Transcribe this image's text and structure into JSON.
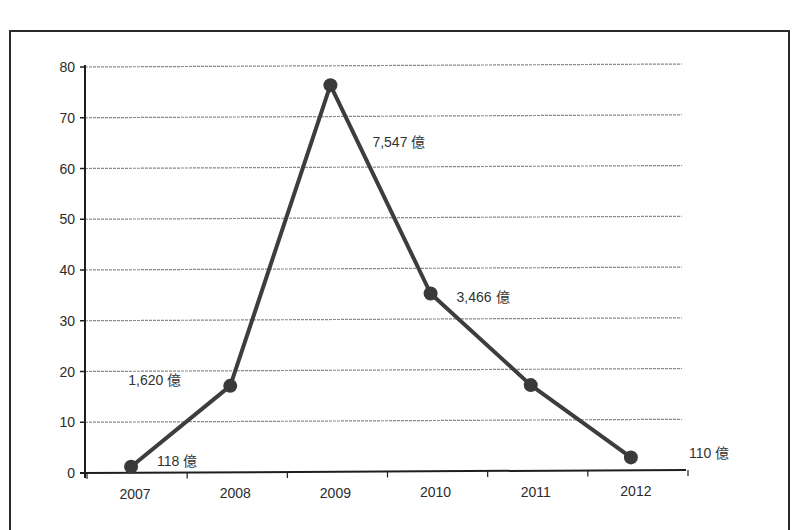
{
  "chart_data": {
    "type": "line",
    "title": "",
    "xlabel": "",
    "ylabel": "",
    "categories": [
      "2007",
      "2008",
      "2009",
      "2010",
      "2011",
      "2012"
    ],
    "series": [
      {
        "name": "",
        "values": [
          1.2,
          17.1,
          76.3,
          35.2,
          17.1,
          2.8
        ],
        "color": "#3d3d3d"
      }
    ],
    "y_ticks": [
      "0",
      "10",
      "20",
      "30",
      "40",
      "50",
      "60",
      "70",
      "80"
    ],
    "ylim": [
      0,
      80
    ],
    "grid": true,
    "legend": "none",
    "annotations": [
      {
        "text": "118 億",
        "category": "2007"
      },
      {
        "text": "1,620 億",
        "category": "2008"
      },
      {
        "text": "7,547 億",
        "category": "2009"
      },
      {
        "text": "3,466 億",
        "category": "2010"
      },
      {
        "text": "110 億",
        "category": "2012"
      }
    ]
  },
  "colors": {
    "line": "#3d3d3d",
    "marker": "#3a3a3a",
    "grid": "#8a8a8a",
    "axis": "#1e1e1e",
    "text": "#2b2b2b"
  }
}
